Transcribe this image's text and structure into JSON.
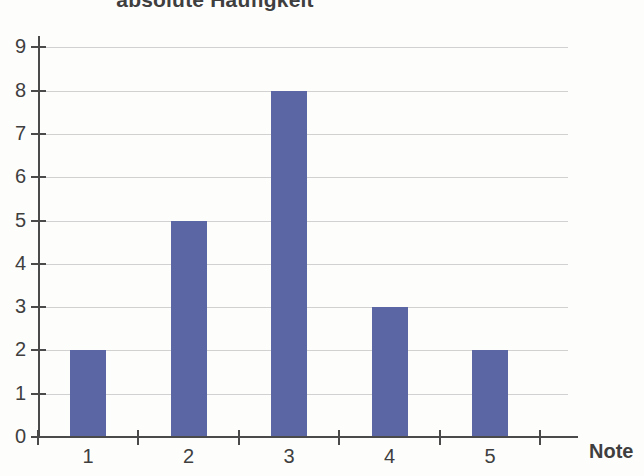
{
  "chart_data": {
    "type": "bar",
    "title": "absolute Häufigkeit",
    "xlabel": "Note",
    "ylabel": "",
    "categories": [
      "1",
      "2",
      "3",
      "4",
      "5"
    ],
    "values": [
      2,
      5,
      8,
      3,
      2
    ],
    "ylim": [
      0,
      9
    ],
    "xlim": [
      0.5,
      5.5
    ],
    "y_ticks": [
      "0",
      "1",
      "2",
      "3",
      "4",
      "5",
      "6",
      "7",
      "8",
      "9"
    ],
    "x_ticks": [
      "1",
      "2",
      "3",
      "4",
      "5"
    ],
    "grid": true,
    "legend": false,
    "legend_position": "none",
    "bar_color": "#5b67a5",
    "grid_color": "#c9c9c9",
    "axis_color": "#4a4a4a",
    "text_color": "#3f3f3f",
    "background_color": "#fdfdfc"
  }
}
